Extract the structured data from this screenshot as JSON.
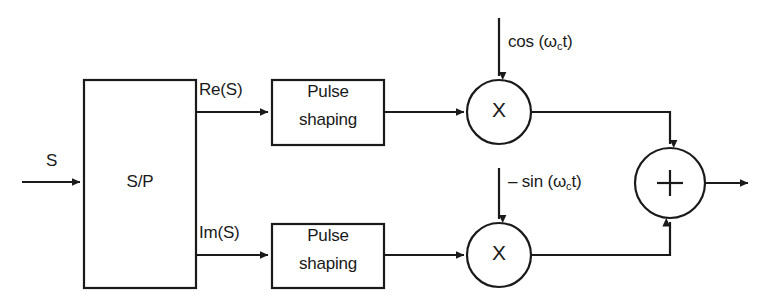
{
  "diagram": {
    "stroke_color": "#1a1a1a",
    "background": "#ffffff",
    "input": {
      "label": "S",
      "arrow_name": "input-signal-arrow"
    },
    "serial_to_parallel": {
      "label": "S/P"
    },
    "branches": [
      {
        "id": "inphase",
        "signal_label": "Re(S)",
        "shaping_label_line1": "Pulse",
        "shaping_label_line2": "shaping",
        "mixer_label": "X",
        "carrier_prefix": "cos (",
        "carrier_omega": "ω",
        "carrier_sub": "c",
        "carrier_suffix": "t)"
      },
      {
        "id": "quadrature",
        "signal_label": "Im(S)",
        "shaping_label_line1": "Pulse",
        "shaping_label_line2": "shaping",
        "mixer_label": "X",
        "carrier_prefix": "– sin (",
        "carrier_omega": "ω",
        "carrier_sub": "c",
        "carrier_suffix": "t)"
      }
    ],
    "summer": {
      "label": "+"
    }
  }
}
